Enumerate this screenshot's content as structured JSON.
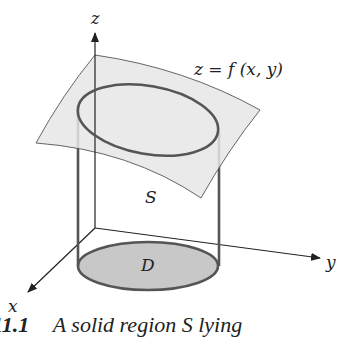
{
  "figure": {
    "labels": {
      "z_axis": "z",
      "y_axis": "y",
      "x_axis": "x",
      "surface_equation": "z = f (x, y)",
      "solid": "S",
      "region": "D"
    },
    "caption": {
      "number": "11.1",
      "text": "A solid region S lying",
      "visibility": "partially cut off at bottom edge"
    },
    "colors": {
      "surface_fill": "#e6e6e6",
      "region_fill": "#c8c8c8",
      "cylinder_stroke": "#555555",
      "axis_stroke": "#222222"
    }
  }
}
